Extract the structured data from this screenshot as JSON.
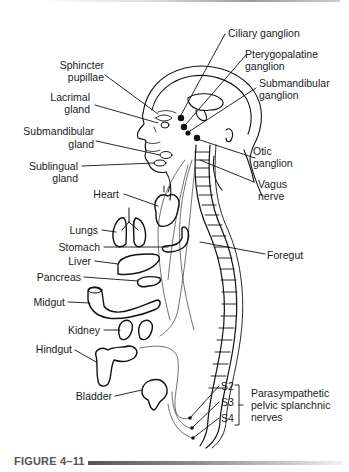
{
  "figure": {
    "caption": "FIGURE 4–11",
    "type": "anatomical diagram of parasympathetic nervous system outflow"
  },
  "labels": {
    "ciliary_ganglion": "Ciliary ganglion",
    "pterygopalatine_ganglion_1": "Pterygopalatine",
    "pterygopalatine_ganglion_2": "ganglion",
    "submandibular_ganglion_1": "Submandibular",
    "submandibular_ganglion_2": "ganglion",
    "otic_ganglion_1": "Otic",
    "otic_ganglion_2": "ganglion",
    "vagus_nerve_1": "Vagus",
    "vagus_nerve_2": "nerve",
    "foregut": "Foregut",
    "sphincter_pupillae_1": "Sphincter",
    "sphincter_pupillae_2": "pupillae",
    "lacrimal_gland_1": "Lacrimal",
    "lacrimal_gland_2": "gland",
    "submandibular_gland_1": "Submandibular",
    "submandibular_gland_2": "gland",
    "sublingual_gland_1": "Sublingual",
    "sublingual_gland_2": "gland",
    "heart": "Heart",
    "lungs": "Lungs",
    "stomach": "Stomach",
    "liver": "Liver",
    "pancreas": "Pancreas",
    "midgut": "Midgut",
    "kidney": "Kidney",
    "hindgut": "Hindgut",
    "bladder": "Bladder",
    "s2": "S2",
    "s3": "S3",
    "s4": "S4",
    "pelvic_1": "Parasympathetic",
    "pelvic_2": "pelvic splanchnic",
    "pelvic_3": "nerves"
  }
}
